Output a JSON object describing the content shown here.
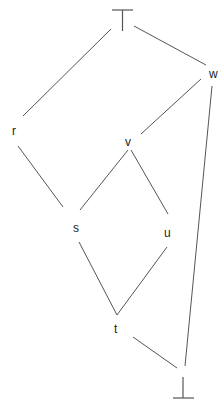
{
  "diagram": {
    "type": "hasse-diagram",
    "line_color": "#555555",
    "label_color": "#222222",
    "nodes": [
      {
        "id": "top",
        "label": "⊤",
        "x": 122,
        "y": 20
      },
      {
        "id": "w",
        "label": "w",
        "x": 212,
        "y": 74
      },
      {
        "id": "r",
        "label": "r",
        "x": 15,
        "y": 130
      },
      {
        "id": "v",
        "label": "v",
        "x": 129,
        "y": 141
      },
      {
        "id": "s",
        "label": "s",
        "x": 77,
        "y": 228
      },
      {
        "id": "u",
        "label": "u",
        "x": 168,
        "y": 232
      },
      {
        "id": "t",
        "label": "t",
        "x": 117,
        "y": 329
      },
      {
        "id": "bottom",
        "label": "⊥",
        "x": 183,
        "y": 388
      }
    ],
    "edges": [
      {
        "from": "top",
        "to": "r"
      },
      {
        "from": "top",
        "to": "w"
      },
      {
        "from": "w",
        "to": "v"
      },
      {
        "from": "w",
        "to": "bottom"
      },
      {
        "from": "r",
        "to": "s"
      },
      {
        "from": "v",
        "to": "s"
      },
      {
        "from": "v",
        "to": "u"
      },
      {
        "from": "s",
        "to": "t"
      },
      {
        "from": "u",
        "to": "t"
      },
      {
        "from": "t",
        "to": "bottom"
      }
    ]
  }
}
